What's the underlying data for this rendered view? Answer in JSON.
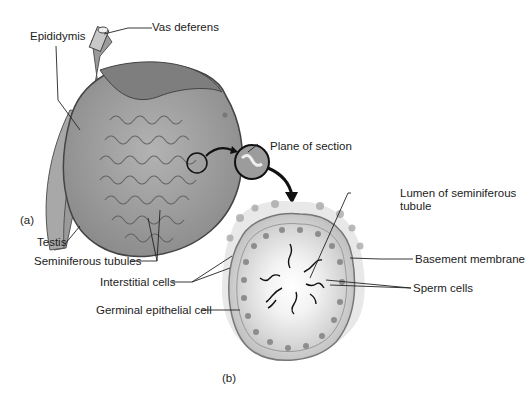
{
  "figure": {
    "panel_a_label": "(a)",
    "panel_b_label": "(b)",
    "labels": {
      "vas_deferens": "Vas deferens",
      "epididymis": "Epididymis",
      "testis": "Testis",
      "seminiferous_tubules": "Seminiferous tubules",
      "plane_of_section": "Plane of section",
      "lumen_line1": "Lumen of seminiferous",
      "lumen_line2": "tubule",
      "basement_membrane": "Basement membrane",
      "sperm_cells": "Sperm cells",
      "interstitial_cells": "Interstitial cells",
      "germinal_epithelial_cell": "Germinal epithelial cell"
    }
  }
}
